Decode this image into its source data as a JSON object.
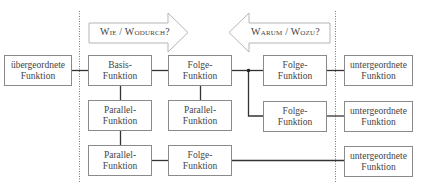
{
  "arrows": {
    "forward": {
      "label": "Wie / Wodurch?",
      "direction": "right"
    },
    "backward": {
      "label": "Warum / Wozu?",
      "direction": "left"
    }
  },
  "boxes": {
    "superior": {
      "line1": "übergeordnete",
      "line2": "Funktion"
    },
    "basis": {
      "line1": "Basis-",
      "line2": "Funktion"
    },
    "follow_r1c2": {
      "line1": "Folge-",
      "line2": "Funktion"
    },
    "follow_r1c3": {
      "line1": "Folge-",
      "line2": "Funktion"
    },
    "sub_r1": {
      "line1": "untergeordnete",
      "line2": "Funktion"
    },
    "parallel_r2c1": {
      "line1": "Parallel-",
      "line2": "Funktion"
    },
    "parallel_r2c2": {
      "line1": "Parallel-",
      "line2": "Funktion"
    },
    "follow_r2c3": {
      "line1": "Folge-",
      "line2": "Funktion"
    },
    "sub_r2": {
      "line1": "untergeordnete",
      "line2": "Funktion"
    },
    "parallel_r3c1": {
      "line1": "Parallel-",
      "line2": "Funktion"
    },
    "follow_r3c2": {
      "line1": "Folge-",
      "line2": "Funktion"
    },
    "sub_r3": {
      "line1": "untergeordnete",
      "line2": "Funktion"
    }
  },
  "colors": {
    "line": "#333333",
    "border": "#8a8a8a",
    "arrow_border": "#b0b0b0",
    "divider": "#777777"
  }
}
